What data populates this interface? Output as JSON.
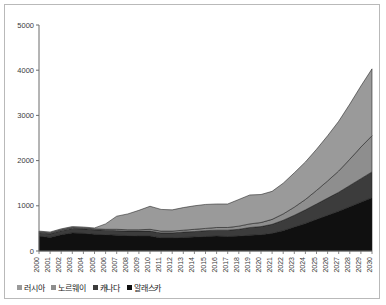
{
  "chart_data": {
    "type": "area",
    "stacked": true,
    "title": "",
    "xlabel": "",
    "ylabel": "",
    "ylim": [
      0,
      5000
    ],
    "yticks": [
      0,
      1000,
      2000,
      3000,
      4000,
      5000
    ],
    "grid": false,
    "legend_position": "bottom-left",
    "categories": [
      "2000",
      "2001",
      "2002",
      "2003",
      "2004",
      "2005",
      "2006",
      "2007",
      "2008",
      "2009",
      "2010",
      "2011",
      "2012",
      "2013",
      "2014",
      "2015",
      "2016",
      "2017",
      "2018",
      "2019",
      "2020",
      "2021",
      "2022",
      "2023",
      "2024",
      "2025",
      "2026",
      "2027",
      "2028",
      "2029",
      "2030"
    ],
    "series": [
      {
        "name": "알래스카",
        "color": "#101010",
        "values": [
          330,
          300,
          360,
          400,
          390,
          370,
          360,
          350,
          340,
          330,
          330,
          290,
          290,
          300,
          310,
          320,
          330,
          320,
          330,
          350,
          360,
          390,
          450,
          530,
          610,
          700,
          790,
          880,
          980,
          1080,
          1180
        ]
      },
      {
        "name": "캐나다",
        "color": "#3c3c3c",
        "values": [
          70,
          80,
          90,
          100,
          100,
          100,
          100,
          100,
          100,
          110,
          110,
          110,
          110,
          120,
          120,
          130,
          130,
          140,
          150,
          170,
          180,
          200,
          230,
          260,
          300,
          340,
          380,
          420,
          470,
          520,
          570
        ]
      },
      {
        "name": "노르웨이",
        "color": "#8e8e8e",
        "values": [
          20,
          20,
          20,
          20,
          20,
          20,
          20,
          30,
          30,
          30,
          40,
          40,
          40,
          40,
          50,
          50,
          60,
          60,
          70,
          80,
          90,
          110,
          140,
          180,
          230,
          300,
          380,
          470,
          580,
          700,
          800
        ]
      },
      {
        "name": "러시아",
        "color": "#9a9a9a",
        "values": [
          20,
          20,
          20,
          20,
          20,
          20,
          120,
          290,
          350,
          430,
          510,
          480,
          470,
          500,
          520,
          530,
          520,
          520,
          590,
          640,
          620,
          620,
          680,
          760,
          830,
          910,
          1000,
          1100,
          1220,
          1350,
          1480
        ]
      }
    ],
    "legend": [
      "러시아",
      "노르웨이",
      "캐나다",
      "알래스카"
    ]
  }
}
